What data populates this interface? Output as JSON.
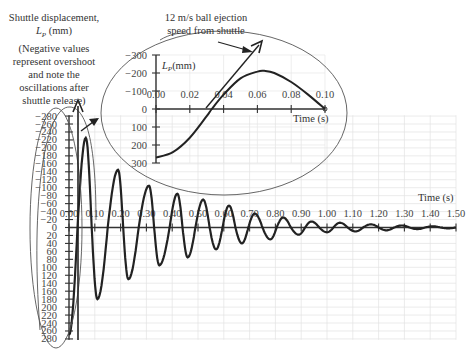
{
  "chart_data": [
    {
      "type": "line",
      "title": "Shuttle displacement vs time (full release oscillation)",
      "ylabel": "Shuttle displacement, L_P (mm)",
      "ylabel_note": "(Negative values represent overshoot and note the oscillations after shuttle release)",
      "xlabel": "Time (s)",
      "xlim": [
        0,
        1.5
      ],
      "ylim": [
        280,
        -280
      ],
      "y_inverted": true,
      "grid": true,
      "x_ticks": [
        "0.00",
        "0.10",
        "0.20",
        "0.30",
        "0.40",
        "0.50",
        "0.60",
        "0.70",
        "0.80",
        "0.90",
        "1.00",
        "1.10",
        "1.20",
        "1.30",
        "1.40",
        "1.50"
      ],
      "y_ticks": [
        "-280",
        "-260",
        "-240",
        "-220",
        "-200",
        "-180",
        "-160",
        "-140",
        "-120",
        "-100",
        "-80",
        "-60",
        "-40",
        "-20",
        "0",
        "20",
        "40",
        "60",
        "80",
        "100",
        "120",
        "140",
        "160",
        "180",
        "200",
        "220",
        "240",
        "260",
        "280"
      ],
      "series": [
        {
          "name": "L_P",
          "x": [
            0.0,
            0.033,
            0.065,
            0.088,
            0.11,
            0.15,
            0.19,
            0.21,
            0.23,
            0.27,
            0.31,
            0.33,
            0.35,
            0.39,
            0.42,
            0.44,
            0.46,
            0.49,
            0.52,
            0.545,
            0.57,
            0.595,
            0.62,
            0.645,
            0.67,
            0.695,
            0.72,
            0.75,
            0.78,
            0.805,
            0.83,
            0.86,
            0.89,
            0.915,
            0.94,
            0.97,
            1.0,
            1.025,
            1.05,
            1.08,
            1.11,
            1.14,
            1.17,
            1.2,
            1.23,
            1.26,
            1.29,
            1.32,
            1.35,
            1.38,
            1.41,
            1.44,
            1.47,
            1.5
          ],
          "y": [
            270,
            0,
            -225,
            0,
            180,
            0,
            -145,
            0,
            130,
            0,
            -105,
            0,
            95,
            0,
            -85,
            0,
            75,
            0,
            -70,
            0,
            55,
            0,
            -55,
            0,
            40,
            0,
            -35,
            0,
            30,
            0,
            -25,
            0,
            18,
            0,
            -15,
            0,
            12,
            0,
            -12,
            0,
            10,
            0,
            -8,
            0,
            7,
            0,
            -5,
            0,
            4,
            0,
            -3,
            0,
            2,
            0
          ]
        }
      ]
    },
    {
      "type": "line",
      "title": "Inset: first 0.1 s",
      "ylabel": "L_P (mm)",
      "xlabel": "Time (s)",
      "xlim": [
        0,
        0.1
      ],
      "ylim": [
        300,
        -300
      ],
      "y_inverted": true,
      "x_ticks": [
        "0.00",
        "0.02",
        "0.04",
        "0.06",
        "0.08",
        "0.10"
      ],
      "y_ticks": [
        "-300",
        "-200",
        "-100",
        "0",
        "100",
        "200",
        "300"
      ],
      "series": [
        {
          "name": "L_P",
          "x": [
            0.0,
            0.01,
            0.02,
            0.03,
            0.033,
            0.04,
            0.05,
            0.06,
            0.064,
            0.07,
            0.08,
            0.09,
            0.1
          ],
          "y": [
            270,
            240,
            160,
            40,
            0,
            -80,
            -170,
            -208,
            -212,
            -200,
            -150,
            -80,
            0
          ]
        }
      ],
      "annotations": [
        {
          "text": "12 m/s ball ejection speed from shuttle",
          "type": "arrow-tangent"
        }
      ]
    }
  ],
  "labels": {
    "ylabel_line1": "Shuttle displacement,",
    "ylabel_line2_symbol": "L",
    "ylabel_line2_sub": "P",
    "ylabel_line2_unit": " (mm)",
    "note_line1": "(Negative values",
    "note_line2": "represent overshoot",
    "note_line3": "and note the",
    "note_line4": "oscillations after",
    "note_line5": "shuttle release)",
    "annotation_line1": "12 m/s ball ejection",
    "annotation_line2": "speed from shuttle",
    "main_xlabel": "Time (s)",
    "inset_xlabel": "Time (s)",
    "inset_ylabel": "(mm)"
  },
  "colors": {
    "curve": "#222222",
    "grid": "#dddddd",
    "ellipse": "#555555"
  }
}
